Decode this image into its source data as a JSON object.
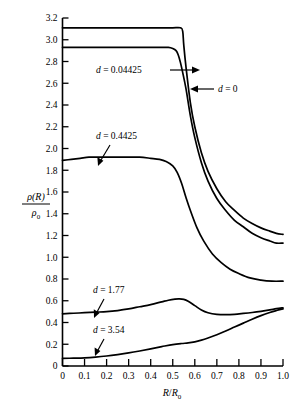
{
  "chart_data": {
    "type": "line",
    "title": "",
    "subtitle": "",
    "xlabel": "R/R0",
    "xlabel_parts": {
      "num": "R",
      "den": "R",
      "den_sub": "0"
    },
    "ylabel": "ρ(R)/ρ0",
    "ylabel_parts": {
      "num_rho": "ρ",
      "num_arg": "(R)",
      "den_rho": "ρ",
      "den_sub": "0"
    },
    "xlim": [
      0,
      1.0
    ],
    "ylim": [
      0,
      3.2
    ],
    "xticks": [
      "0",
      "0.1",
      "0.2",
      "0.3",
      "0.4",
      "0.5",
      "0.6",
      "0.7",
      "0.8",
      "0.9",
      "1.0"
    ],
    "xtick_values": [
      0,
      0.1,
      0.2,
      0.3,
      0.4,
      0.5,
      0.6,
      0.7,
      0.8,
      0.9,
      1.0
    ],
    "yticks": [
      "0",
      "0.2",
      "0.4",
      "0.6",
      "0.8",
      "1.0",
      "1.2",
      "1.4",
      "1.6",
      "1.8",
      "2.0",
      "2.2",
      "2.4",
      "2.6",
      "2.8",
      "3.0",
      "3.2"
    ],
    "ytick_values": [
      0,
      0.2,
      0.4,
      0.6,
      0.8,
      1.0,
      1.2,
      1.4,
      1.6,
      1.8,
      2.0,
      2.2,
      2.4,
      2.6,
      2.8,
      3.0,
      3.2
    ],
    "grid": false,
    "legend_position": "inline-annotations",
    "series": [
      {
        "name": "d = 0",
        "label": "d = 0",
        "label_var": "d",
        "label_value": "0",
        "x": [
          0.0,
          0.05,
          0.1,
          0.15,
          0.2,
          0.25,
          0.3,
          0.35,
          0.4,
          0.45,
          0.5,
          0.535,
          0.545,
          0.55,
          0.56,
          0.58,
          0.6,
          0.63,
          0.66,
          0.7,
          0.74,
          0.78,
          0.82,
          0.86,
          0.9,
          0.94,
          0.97,
          1.0
        ],
        "values": [
          3.11,
          3.11,
          3.11,
          3.11,
          3.11,
          3.11,
          3.11,
          3.11,
          3.11,
          3.11,
          3.11,
          3.11,
          3.08,
          2.95,
          2.75,
          2.42,
          2.2,
          1.96,
          1.79,
          1.63,
          1.51,
          1.43,
          1.36,
          1.31,
          1.27,
          1.24,
          1.22,
          1.21
        ]
      },
      {
        "name": "d = 0.04425",
        "label": "d = 0.04425",
        "label_var": "d",
        "label_value": "0.04425",
        "x": [
          0.0,
          0.05,
          0.1,
          0.15,
          0.2,
          0.25,
          0.3,
          0.35,
          0.4,
          0.45,
          0.48,
          0.5,
          0.515,
          0.525,
          0.535,
          0.545,
          0.56,
          0.58,
          0.6,
          0.63,
          0.66,
          0.7,
          0.74,
          0.78,
          0.82,
          0.86,
          0.9,
          0.94,
          0.97,
          1.0
        ],
        "values": [
          2.93,
          2.93,
          2.93,
          2.93,
          2.93,
          2.93,
          2.93,
          2.93,
          2.93,
          2.93,
          2.93,
          2.92,
          2.9,
          2.86,
          2.79,
          2.7,
          2.55,
          2.3,
          2.1,
          1.87,
          1.7,
          1.54,
          1.43,
          1.34,
          1.28,
          1.22,
          1.18,
          1.15,
          1.13,
          1.13
        ]
      },
      {
        "name": "d = 0.4425",
        "label": "d = 0.4425",
        "label_var": "d",
        "label_value": "0.4425",
        "x": [
          0.0,
          0.04,
          0.08,
          0.12,
          0.16,
          0.2,
          0.25,
          0.3,
          0.35,
          0.4,
          0.44,
          0.47,
          0.5,
          0.52,
          0.54,
          0.56,
          0.58,
          0.61,
          0.64,
          0.68,
          0.72,
          0.76,
          0.8,
          0.85,
          0.9,
          0.95,
          1.0
        ],
        "values": [
          1.89,
          1.9,
          1.91,
          1.92,
          1.92,
          1.92,
          1.92,
          1.92,
          1.92,
          1.91,
          1.9,
          1.88,
          1.84,
          1.78,
          1.68,
          1.55,
          1.43,
          1.27,
          1.15,
          1.03,
          0.95,
          0.89,
          0.85,
          0.81,
          0.79,
          0.78,
          0.78
        ]
      },
      {
        "name": "d = 1.77",
        "label": "d = 1.77",
        "label_var": "d",
        "label_value": "1.77",
        "x": [
          0.0,
          0.05,
          0.1,
          0.15,
          0.2,
          0.25,
          0.3,
          0.35,
          0.4,
          0.45,
          0.48,
          0.51,
          0.53,
          0.55,
          0.57,
          0.6,
          0.63,
          0.66,
          0.7,
          0.74,
          0.78,
          0.82,
          0.86,
          0.9,
          0.94,
          0.97,
          1.0
        ],
        "values": [
          0.48,
          0.485,
          0.49,
          0.495,
          0.5,
          0.51,
          0.525,
          0.545,
          0.565,
          0.59,
          0.605,
          0.615,
          0.617,
          0.612,
          0.595,
          0.555,
          0.515,
          0.49,
          0.475,
          0.472,
          0.475,
          0.483,
          0.492,
          0.503,
          0.516,
          0.527,
          0.535
        ]
      },
      {
        "name": "d = 3.54",
        "label": "d = 3.54",
        "label_var": "d",
        "label_value": "3.54",
        "x": [
          0.0,
          0.05,
          0.1,
          0.15,
          0.2,
          0.25,
          0.3,
          0.35,
          0.4,
          0.45,
          0.5,
          0.54,
          0.57,
          0.6,
          0.63,
          0.66,
          0.7,
          0.74,
          0.78,
          0.82,
          0.86,
          0.9,
          0.94,
          0.97,
          1.0
        ],
        "values": [
          0.07,
          0.072,
          0.075,
          0.082,
          0.092,
          0.105,
          0.12,
          0.138,
          0.158,
          0.178,
          0.197,
          0.207,
          0.212,
          0.222,
          0.238,
          0.258,
          0.288,
          0.322,
          0.358,
          0.394,
          0.43,
          0.463,
          0.492,
          0.51,
          0.525
        ]
      }
    ],
    "annotations": [
      {
        "text": "d = 0.04425",
        "target_series": "d = 0.04425",
        "arrow": "right"
      },
      {
        "text": "d = 0",
        "target_series": "d = 0",
        "arrow": "left"
      },
      {
        "text": "d = 0.4425",
        "target_series": "d = 0.4425",
        "arrow": "down-left"
      },
      {
        "text": "d = 1.77",
        "target_series": "d = 1.77",
        "arrow": "down-left"
      },
      {
        "text": "d = 3.54",
        "target_series": "d = 3.54",
        "arrow": "down-left"
      }
    ],
    "colors": {
      "line": "#000000",
      "axis": "#000000",
      "background": "#ffffff"
    }
  }
}
